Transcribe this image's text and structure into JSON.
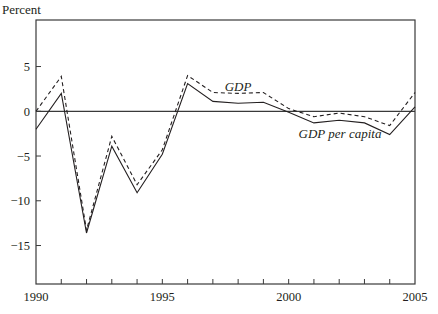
{
  "chart_data": {
    "type": "line",
    "title": "",
    "xlabel": "",
    "ylabel": "Percent",
    "x": [
      1990,
      1991,
      1992,
      1993,
      1994,
      1995,
      1996,
      1997,
      1998,
      1999,
      2000,
      2001,
      2002,
      2003,
      2004,
      2005
    ],
    "series": [
      {
        "name": "GDP",
        "style": "dashed",
        "values": [
          0.0,
          3.9,
          -13.3,
          -2.8,
          -8.2,
          -4.3,
          4.0,
          2.1,
          2.0,
          2.1,
          0.3,
          -0.6,
          -0.2,
          -0.6,
          -1.6,
          2.1
        ]
      },
      {
        "name": "GDP per capita",
        "style": "solid",
        "values": [
          -2.0,
          2.0,
          -13.6,
          -3.9,
          -9.1,
          -4.8,
          3.1,
          1.1,
          0.9,
          1.0,
          -0.1,
          -1.3,
          -1.0,
          -1.3,
          -2.6,
          0.5
        ]
      }
    ],
    "xlim": [
      1990,
      2005
    ],
    "ylim": [
      -19.3,
      10.2
    ],
    "x_tick_labels": [
      "1990",
      "1995",
      "2000",
      "2005"
    ],
    "x_tick_label_values": [
      1990,
      1995,
      2000,
      2005
    ],
    "x_minor_ticks_every": 1,
    "y_tick_labels": [
      "5",
      "0",
      "−5",
      "−10",
      "−15"
    ],
    "y_tick_values": [
      5,
      0,
      -5,
      -10,
      -15
    ],
    "reference_line": 0,
    "grid": false,
    "legend": "inline labels",
    "annotations": [
      {
        "text": "GDP",
        "series": "GDP",
        "x_px": 238,
        "y_px": 91
      },
      {
        "text": "GDP per capita",
        "series": "GDP per capita",
        "x_px": 340,
        "y_px": 138
      }
    ]
  },
  "labels": {
    "y_axis_title": "Percent",
    "gdp_label": "GDP",
    "gdp_per_capita_label": "GDP per capita"
  }
}
